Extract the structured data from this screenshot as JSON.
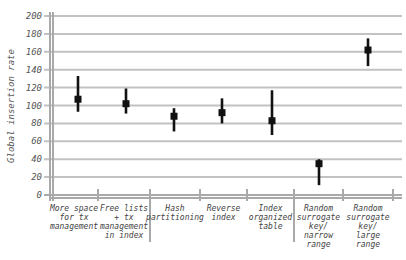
{
  "chart_data": {
    "type": "scatter",
    "title": "",
    "xlabel": "",
    "ylabel": "Global insertion rate",
    "ylim": [
      0,
      200
    ],
    "yticks": [
      0,
      20,
      40,
      60,
      80,
      100,
      120,
      140,
      160,
      180,
      200
    ],
    "grid": true,
    "legend": "none",
    "categories": [
      [
        "More space",
        "for tx",
        "management"
      ],
      [
        "Free lists",
        "+ tx",
        "management",
        "in index"
      ],
      [
        "Hash",
        "partitioning"
      ],
      [
        "Reverse",
        "index"
      ],
      [
        "Index",
        "organized",
        "table"
      ],
      [
        "Random",
        "surrogate",
        "key/",
        "narrow",
        "range"
      ],
      [
        "Random",
        "surrogate",
        "key/",
        "large",
        "range"
      ]
    ],
    "groups": [
      [
        0,
        1
      ],
      [
        2,
        3,
        4
      ],
      [
        5,
        6
      ]
    ],
    "series": [
      {
        "name": "Global insertion rate",
        "values": [
          107,
          102,
          88,
          92,
          83,
          35,
          162
        ],
        "low": [
          93,
          91,
          71,
          80,
          67,
          11,
          144
        ],
        "high": [
          133,
          119,
          97,
          108,
          117,
          40,
          175
        ]
      }
    ]
  }
}
